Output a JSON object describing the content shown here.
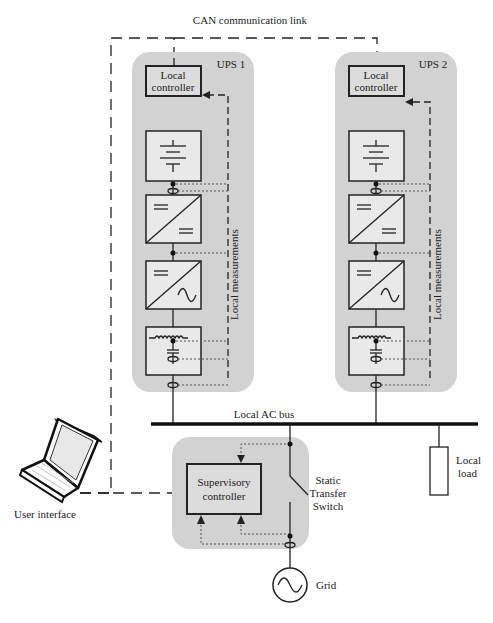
{
  "title": "CAN communication link",
  "ups_units": [
    {
      "label": "UPS 1",
      "controller": [
        "Local",
        "controller"
      ],
      "measurements": "Local measurements"
    },
    {
      "label": "UPS 2",
      "controller": [
        "Local",
        "controller"
      ],
      "measurements": "Local measurements"
    }
  ],
  "stages": [
    "battery-icon",
    "dc-dc-converter-icon",
    "dc-ac-inverter-icon",
    "lc-filter-icon"
  ],
  "bus": {
    "label": "Local AC bus"
  },
  "supervisory": {
    "controller": [
      "Supervisory",
      "controller"
    ]
  },
  "switch": {
    "label": [
      "Static",
      "Transfer",
      "Switch"
    ]
  },
  "load": {
    "label": [
      "Local",
      "load"
    ]
  },
  "grid": {
    "label": "Grid"
  },
  "user_interface": {
    "label": "User interface"
  },
  "colors": {
    "panel": "#d2d2d2",
    "box": "#e9e9e9",
    "line": "#222222"
  }
}
